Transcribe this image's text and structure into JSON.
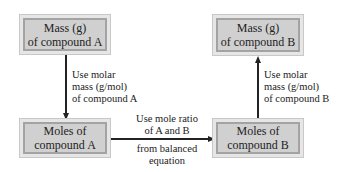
{
  "boxes": {
    "mass_a": {
      "line1": "Mass (g)",
      "line2": "of compound A"
    },
    "moles_a": {
      "line1": "Moles of",
      "line2": "compound A"
    },
    "mass_b": {
      "line1": "Mass (g)",
      "line2": "of compound B"
    },
    "moles_b": {
      "line1": "Moles of",
      "line2": "compound B"
    }
  },
  "labels": {
    "a_molar": [
      "Use molar",
      "mass (g/mol)",
      "of compound A"
    ],
    "b_molar": [
      "Use molar",
      "mass (g/mol)",
      "of compound B"
    ],
    "ratio_top": [
      "Use mole ratio",
      "of A and B"
    ],
    "ratio_bottom": [
      "from balanced",
      "equation"
    ]
  },
  "colors": {
    "box_fill": "#d0d0d0",
    "box_border": "#a3a3a3",
    "arrow": "#222222"
  }
}
